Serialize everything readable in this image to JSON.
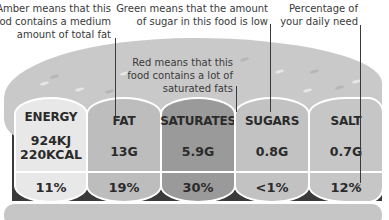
{
  "annotations": {
    "amber": [
      "Amber means that this",
      "food contains a medium",
      "amount of total fat"
    ],
    "green": [
      "Green means that the amount",
      "of sugar in this food is low"
    ],
    "red": [
      "Red means that this",
      "food contains a lot of",
      "saturated fats"
    ],
    "percentage": [
      "Percentage of",
      "your daily need"
    ]
  },
  "nutrients": [
    {
      "label": "ENERGY",
      "value_lines": [
        "924KJ",
        "220KCAL"
      ],
      "percent": "11%",
      "color": "#e8e8e8"
    },
    {
      "label": "FAT",
      "value_lines": [
        "13G"
      ],
      "percent": "19%",
      "color": "#bdbdbd"
    },
    {
      "label": "SATURATES",
      "value_lines": [
        "5.9G"
      ],
      "percent": "30%",
      "color": "#9a9a9a"
    },
    {
      "label": "SUGARS",
      "value_lines": [
        "0.8G"
      ],
      "percent": "<1%",
      "color": "#c2c2c2"
    },
    {
      "label": "SALT",
      "value_lines": [
        "0.7G"
      ],
      "percent": "12%",
      "color": "#c6c6c6"
    }
  ]
}
